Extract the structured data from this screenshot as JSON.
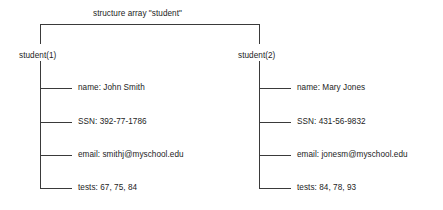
{
  "diagram": {
    "title": "structure array \"student\"",
    "title_x": 93,
    "title_y": 10,
    "bracket": {
      "left_x": 40,
      "right_x": 259,
      "top_y": 24,
      "drop_y": 44
    },
    "branches": [
      {
        "node_label": "student(1)",
        "node_x": 17,
        "node_y": 51,
        "spine_x": 40,
        "spine_top": 58,
        "spine_bottom": 188,
        "tick_end_x": 72,
        "text_x": 78,
        "fields": [
          {
            "label": "name: John Smith",
            "y": 88
          },
          {
            "label": "SSN: 392-77-1786",
            "y": 122
          },
          {
            "label": "email: smithj@myschool.edu",
            "y": 155
          },
          {
            "label": "tests: 67, 75, 84",
            "y": 188
          }
        ]
      },
      {
        "node_label": "student(2)",
        "node_x": 236,
        "node_y": 51,
        "spine_x": 259,
        "spine_top": 58,
        "spine_bottom": 188,
        "tick_end_x": 291,
        "text_x": 297,
        "fields": [
          {
            "label": "name: Mary Jones",
            "y": 88
          },
          {
            "label": "SSN: 431-56-9832",
            "y": 122
          },
          {
            "label": "email: jonesm@myschool.edu",
            "y": 155
          },
          {
            "label": "tests: 84, 78, 93",
            "y": 188
          }
        ]
      }
    ],
    "line_color": "#3a3a3a",
    "text_color": "#1c1c1c"
  }
}
